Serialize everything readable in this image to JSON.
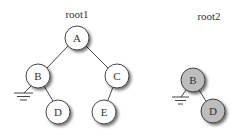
{
  "diagram": {
    "type": "binary-tree-comparison",
    "colors": {
      "node_fill_root1": "#ffffff",
      "node_fill_root2": "#bdbdbd",
      "stroke": "#333333",
      "shadow": "#9a9a9a"
    },
    "trees": [
      {
        "label": "root1",
        "label_pos": [
          77,
          17
        ],
        "nodes": [
          {
            "id": "A",
            "label": "A",
            "x": 77,
            "y": 38
          },
          {
            "id": "B",
            "label": "B",
            "x": 38,
            "y": 76
          },
          {
            "id": "C",
            "label": "C",
            "x": 117,
            "y": 76
          },
          {
            "id": "D",
            "label": "D",
            "x": 58,
            "y": 112
          },
          {
            "id": "E",
            "label": "E",
            "x": 104,
            "y": 112
          }
        ],
        "edges": [
          [
            "A",
            "B"
          ],
          [
            "A",
            "C"
          ],
          [
            "B",
            "D"
          ],
          [
            "C",
            "E"
          ]
        ],
        "null_pointers": [
          {
            "from": "B",
            "side": "left"
          }
        ]
      },
      {
        "label": "root2",
        "label_pos": [
          209,
          19
        ],
        "nodes": [
          {
            "id": "B",
            "label": "B",
            "x": 193,
            "y": 80
          },
          {
            "id": "D",
            "label": "D",
            "x": 213,
            "y": 111
          }
        ],
        "edges": [
          [
            "B",
            "D"
          ]
        ],
        "null_pointers": [
          {
            "from": "B",
            "side": "left"
          }
        ]
      }
    ]
  }
}
